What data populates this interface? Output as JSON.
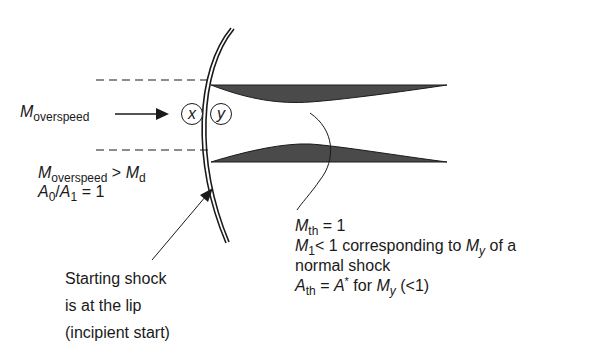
{
  "diagram": {
    "type": "inlet-starting-shock",
    "colors": {
      "ink": "#1a1a1a",
      "cowl_fill": "#4a4a4a",
      "background": "#ffffff"
    },
    "freestream": {
      "symbol": "M",
      "subscript": "overspeed",
      "arrow": "arrow-right"
    },
    "stations": {
      "upstream": "x",
      "downstream": "y"
    },
    "conditions_left": {
      "line1": {
        "lhs_symbol": "M",
        "lhs_subscript": "overspeed",
        "operator": ">",
        "rhs_symbol": "M",
        "rhs_subscript": "d"
      },
      "line2": {
        "num_symbol": "A",
        "num_subscript": "0",
        "slash": "/",
        "den_symbol": "A",
        "den_subscript": "1",
        "equals": "= 1"
      }
    },
    "shock_annotation": {
      "line1": "Starting shock",
      "line2": "is at the lip",
      "line3": "(incipient start)"
    },
    "throat_annotation": {
      "line1": {
        "symbol": "M",
        "subscript": "th",
        "value": " = 1"
      },
      "line2": {
        "symbol": "M",
        "subscript": "1",
        "text_a": "< 1 corresponding to ",
        "symbol2": "M",
        "subscript2": "y",
        "text_b": " of a"
      },
      "line3": "normal shock",
      "line4": {
        "symbol": "A",
        "subscript": "th",
        "equals": " = ",
        "symbol2": "A",
        "superscript2": "*",
        "text_a": " for ",
        "symbol3": "M",
        "subscript3": "y",
        "text_b": " (<1)"
      }
    }
  }
}
